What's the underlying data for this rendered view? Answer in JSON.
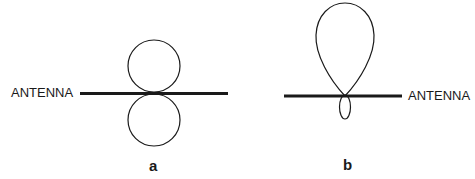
{
  "diagrams": [
    {
      "caption": "a",
      "antenna_label": "ANTENNA",
      "pattern": "figure-eight (bidirectional) radiation pattern perpendicular to antenna"
    },
    {
      "caption": "b",
      "antenna_label": "ANTENNA",
      "pattern": "directional main lobe with small back lobe"
    }
  ],
  "colors": {
    "stroke": "#1a1a1a",
    "background": "#ffffff"
  }
}
